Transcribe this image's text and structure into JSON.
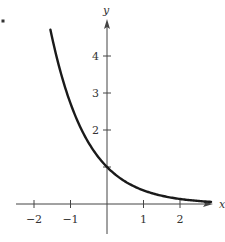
{
  "chart_data": {
    "type": "line",
    "title": "",
    "xlabel": "x",
    "ylabel": "y",
    "function": "y = e^(-x)",
    "xlim": [
      -2.5,
      3.0
    ],
    "ylim": [
      0,
      5.0
    ],
    "x_ticks": [
      -2,
      -1,
      0,
      1,
      2
    ],
    "x_tick_labels": [
      "−2",
      "−1",
      "",
      "1",
      "2"
    ],
    "y_ticks": [
      1,
      2,
      3,
      4
    ],
    "y_tick_labels": [
      "",
      "2",
      "3",
      "4"
    ],
    "grid": false,
    "series": [
      {
        "name": "curve",
        "x": [
          -1.55,
          -1.25,
          -1.0,
          -0.75,
          -0.5,
          -0.25,
          0,
          0.25,
          0.5,
          0.75,
          1.0,
          1.5,
          2.0,
          2.5,
          2.85
        ],
        "values": [
          4.71,
          3.49,
          2.72,
          2.12,
          1.65,
          1.28,
          1.0,
          0.78,
          0.61,
          0.47,
          0.37,
          0.22,
          0.14,
          0.08,
          0.06
        ]
      }
    ],
    "color": "#1a1a1a"
  },
  "marker": {
    "label": "•"
  }
}
